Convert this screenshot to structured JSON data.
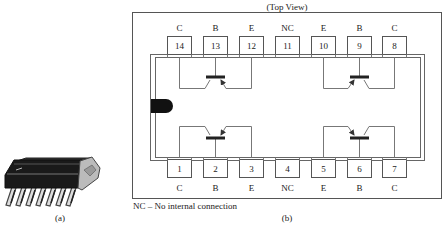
{
  "figure_a": {
    "caption": "(a)",
    "description": "14-pin dual in-line package (DIP) perspective drawing"
  },
  "figure_b": {
    "title": "(Top View)",
    "caption": "(b)",
    "footnote": "NC – No internal connection",
    "top_pins": [
      {
        "number": "14",
        "label": "C"
      },
      {
        "number": "13",
        "label": "B"
      },
      {
        "number": "12",
        "label": "E"
      },
      {
        "number": "11",
        "label": "NC"
      },
      {
        "number": "10",
        "label": "E"
      },
      {
        "number": "9",
        "label": "B"
      },
      {
        "number": "8",
        "label": "C"
      }
    ],
    "bottom_pins": [
      {
        "number": "1",
        "label": "C"
      },
      {
        "number": "2",
        "label": "B"
      },
      {
        "number": "3",
        "label": "E"
      },
      {
        "number": "4",
        "label": "NC"
      },
      {
        "number": "5",
        "label": "E"
      },
      {
        "number": "6",
        "label": "B"
      },
      {
        "number": "7",
        "label": "C"
      }
    ],
    "transistors": [
      {
        "id": "Q1",
        "position": "top-left",
        "collector_pin": "14",
        "base_pin": "13",
        "emitter_pin": "12"
      },
      {
        "id": "Q2",
        "position": "top-right",
        "emitter_pin": "10",
        "base_pin": "9",
        "collector_pin": "8"
      },
      {
        "id": "Q3",
        "position": "bottom-left",
        "collector_pin": "1",
        "base_pin": "2",
        "emitter_pin": "3"
      },
      {
        "id": "Q4",
        "position": "bottom-right",
        "emitter_pin": "5",
        "base_pin": "6",
        "collector_pin": "7"
      }
    ]
  }
}
